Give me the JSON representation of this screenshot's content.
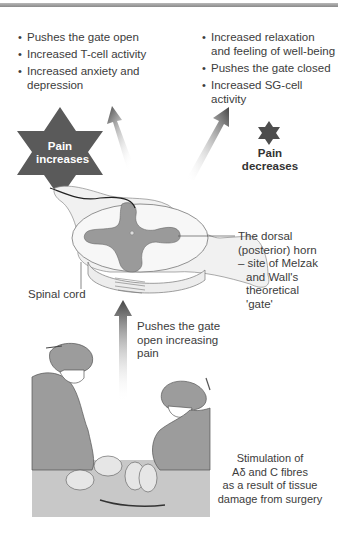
{
  "figure": {
    "left_effects": [
      "Pushes the gate open",
      "Increased T-cell activity",
      "Increased anxiety and depression"
    ],
    "right_effects": [
      "Increased relaxation and feeling of well-being",
      "Pushes the gate closed",
      "Increased SG-cell activity"
    ],
    "pain_increases_label": "Pain increases",
    "pain_increases_line1": "Pain",
    "pain_increases_line2": "increases",
    "pain_decreases_line1": "Pain",
    "pain_decreases_line2": "decreases",
    "spinal_cord_label": "Spinal cord",
    "dorsal_horn_label": {
      "line1": "The dorsal",
      "line2": "(posterior) horn",
      "line3": "– site of Melzak",
      "line4": "and Wall's",
      "line5": "theoretical",
      "line6": "'gate'"
    },
    "upward_arrow_label": {
      "line1": "Pushes the gate",
      "line2": "open increasing",
      "line3": "pain"
    },
    "stimulation_label": {
      "line1": "Stimulation of",
      "line2": "Aδ and C fibres",
      "line3": "as a result of tissue",
      "line4": "damage from surgery"
    },
    "colors": {
      "dark_star": "#555555",
      "grey_matter": "#9a9a9a",
      "surgeon_fill": "#9c9c9c",
      "arrow_dark": "#4a4a4a"
    }
  }
}
